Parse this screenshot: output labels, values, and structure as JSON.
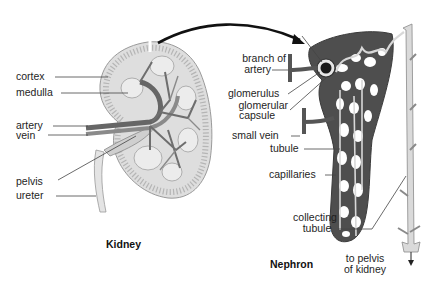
{
  "kidney": {
    "title": "Kidney",
    "labels": {
      "cortex": "cortex",
      "medulla": "medulla",
      "artery": "artery",
      "vein": "vein",
      "pelvis": "pelvis",
      "ureter": "ureter"
    }
  },
  "nephron": {
    "title": "Nephron",
    "labels": {
      "branch_of_artery_1": "branch of",
      "branch_of_artery_2": "artery",
      "glomerulus": "glomerulus",
      "glomerular_capsule_1": "glomerular",
      "glomerular_capsule_2": "capsule",
      "small_vein": "small vein",
      "tubule": "tubule",
      "capillaries": "capillaries",
      "collecting_tubule_1": "collecting",
      "collecting_tubule_2": "tubule",
      "to_pelvis_1": "to pelvis",
      "to_pelvis_2": "of kidney"
    }
  },
  "colors": {
    "kidney_tissue": "#d9d9d9",
    "vessel": "#707070",
    "vessel_dark": "#555555",
    "tubule_light": "#dcdcdc",
    "line": "#333333"
  }
}
